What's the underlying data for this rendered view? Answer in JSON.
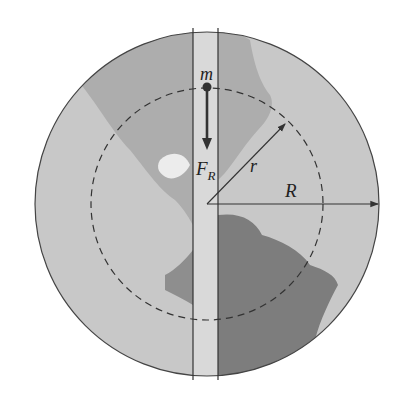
{
  "diagram": {
    "labels": {
      "mass": "m",
      "force": "F",
      "force_sub": "R",
      "radius_inner": "r",
      "radius_outer": "R"
    },
    "colors": {
      "ocean": "#c9c9c9",
      "land_light": "#e4e4e4",
      "land_mid": "#a8a8a8",
      "land_dark": "#7f7f7f",
      "tunnel": "#dadada",
      "lines": "#333333"
    }
  }
}
